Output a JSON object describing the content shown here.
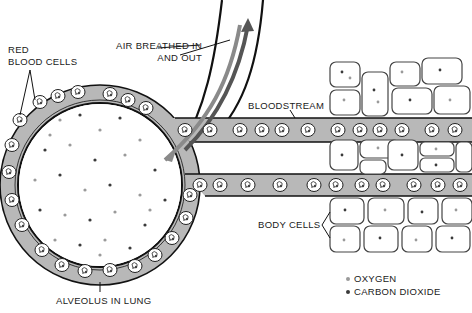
{
  "diagram": {
    "labels": {
      "red_blood_cells": [
        "RED",
        "BLOOD CELLS"
      ],
      "air_breathed": [
        "AIR BREATHED IN",
        "AND OUT"
      ],
      "bloodstream": "BLOODSTREAM",
      "body_cells": "BODY CELLS",
      "alveolus": "ALVEOLUS IN LUNG"
    },
    "legend": [
      {
        "symbol": "light-dot",
        "label": "OXYGEN",
        "color": "#9a9a9a"
      },
      {
        "symbol": "dark-dot",
        "label": "CARBON DIOXIDE",
        "color": "#3a3a3a"
      }
    ],
    "colors": {
      "vessel": "#b8b8b8",
      "outline": "#111111",
      "arrow_in": "#8a8a8a",
      "arrow_out": "#555555"
    }
  }
}
